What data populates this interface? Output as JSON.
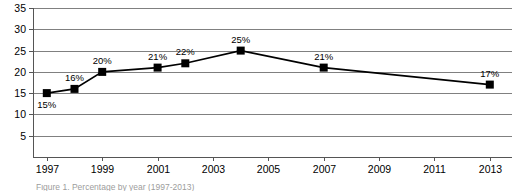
{
  "chart_data": {
    "type": "line",
    "title": "",
    "subtitle": "",
    "xlabel": "",
    "ylabel": "",
    "grid": true,
    "legend": false,
    "xlim": [
      1996.5,
      2013.8
    ],
    "ylim": [
      0,
      35
    ],
    "yticks": [
      5,
      10,
      15,
      20,
      25,
      30,
      35
    ],
    "ytick_labels": [
      "5",
      "10",
      "15",
      "20",
      "25",
      "30",
      "35"
    ],
    "xticks": [
      1997,
      1999,
      2001,
      2003,
      2005,
      2007,
      2009,
      2011,
      2013
    ],
    "xtick_labels": [
      "1997",
      "1999",
      "2001",
      "2003",
      "2005",
      "2007",
      "2009",
      "2011",
      "2013"
    ],
    "marker": "square",
    "line_color": "#000000",
    "marker_color": "#000000",
    "grid_color": "#808080",
    "series": [
      {
        "name": "",
        "x": [
          1997,
          1998,
          1999,
          2001,
          2002,
          2004,
          2007,
          2013
        ],
        "values": [
          15,
          16,
          20,
          21,
          22,
          25,
          21,
          17
        ],
        "data_labels": [
          "15%",
          "16%",
          "20%",
          "21%",
          "22%",
          "25%",
          "21%",
          "17%"
        ],
        "label_positions": [
          "below",
          "above",
          "above",
          "above",
          "above",
          "above",
          "above",
          "above"
        ]
      }
    ]
  },
  "caption": {
    "text": "Figure 1. Percentage by year (1997-2013)"
  }
}
